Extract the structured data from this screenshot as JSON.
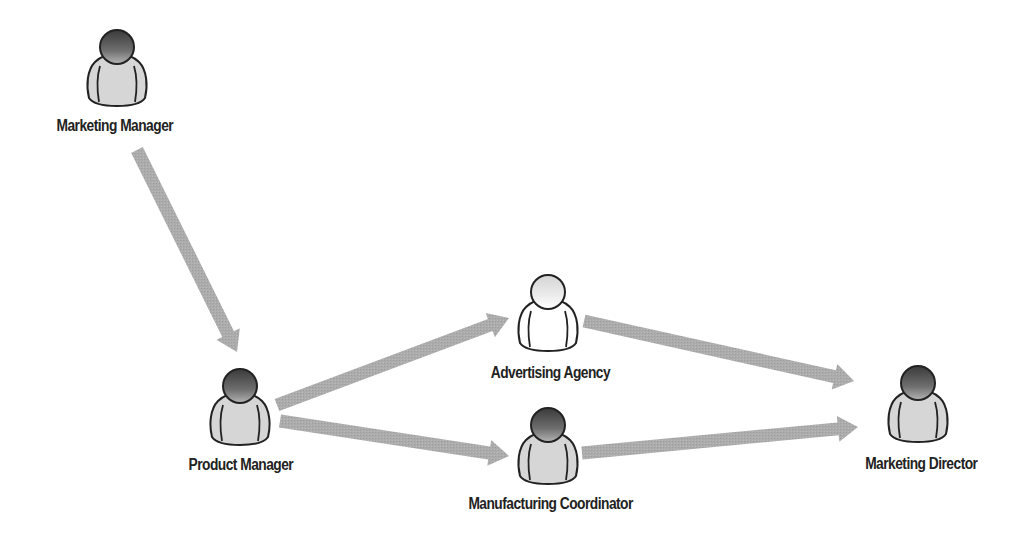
{
  "diagram": {
    "type": "workflow",
    "colors": {
      "arrow": "#a8a8a8",
      "figure_body": "#d6d6d6",
      "figure_head_dark_top": "#9a9a9a",
      "figure_head_dark_bottom": "#2e2e2e",
      "figure_outline": "#222222",
      "highlight_body": "#ffffff",
      "highlight_head_top": "#ffffff",
      "highlight_head_bottom": "#cfcfcf",
      "text": "#222222",
      "background": "#ffffff"
    },
    "nodes": [
      {
        "id": "marketing-manager",
        "label": "Marketing Manager",
        "icon": "person-icon",
        "style": "dark",
        "cx": 117,
        "cy": 68,
        "label_x": 115,
        "label_y": 117
      },
      {
        "id": "product-manager",
        "label": "Product Manager",
        "icon": "person-icon",
        "style": "dark",
        "cx": 240,
        "cy": 407,
        "label_x": 241,
        "label_y": 456
      },
      {
        "id": "advertising-agency",
        "label": "Advertising Agency",
        "icon": "person-icon",
        "style": "highlighted",
        "cx": 548,
        "cy": 313,
        "label_x": 550,
        "label_y": 364
      },
      {
        "id": "manufacturing-coordinator",
        "label": "Manufacturing Coordinator",
        "icon": "person-icon",
        "style": "dark",
        "cx": 548,
        "cy": 446,
        "label_x": 550,
        "label_y": 495
      },
      {
        "id": "marketing-director",
        "label": "Marketing Director",
        "icon": "person-icon",
        "style": "dark",
        "cx": 918,
        "cy": 404,
        "label_x": 921,
        "label_y": 455
      }
    ],
    "edges": [
      {
        "from": "marketing-manager",
        "to": "product-manager",
        "x1": 137,
        "y1": 150,
        "x2": 237,
        "y2": 352
      },
      {
        "from": "product-manager",
        "to": "advertising-agency",
        "x1": 277,
        "y1": 405,
        "x2": 509,
        "y2": 318
      },
      {
        "from": "product-manager",
        "to": "manufacturing-coordinator",
        "x1": 280,
        "y1": 421,
        "x2": 509,
        "y2": 456
      },
      {
        "from": "advertising-agency",
        "to": "marketing-director",
        "x1": 584,
        "y1": 321,
        "x2": 854,
        "y2": 381
      },
      {
        "from": "manufacturing-coordinator",
        "to": "marketing-director",
        "x1": 582,
        "y1": 453,
        "x2": 858,
        "y2": 427
      }
    ]
  }
}
